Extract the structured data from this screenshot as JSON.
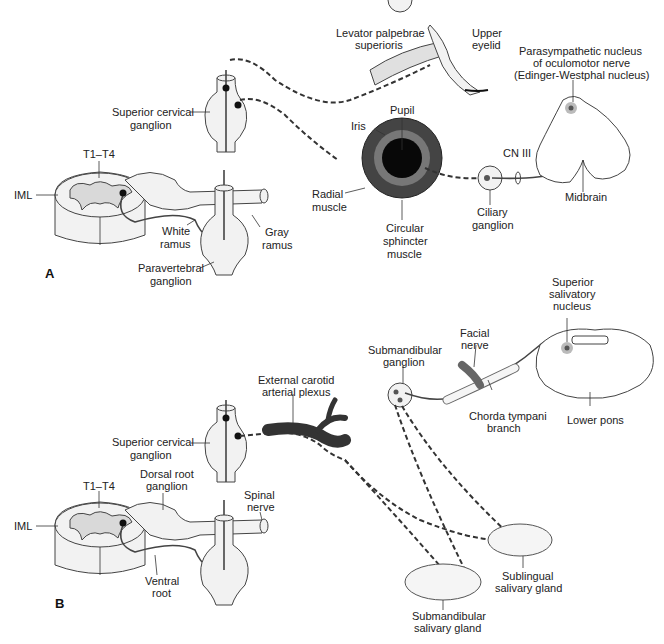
{
  "figure": {
    "panel_a": {
      "letter": "A",
      "labels": {
        "superior_cervical_ganglion_1": "Superior cervical",
        "superior_cervical_ganglion_2": "ganglion",
        "t1_t4": "T1–T4",
        "iml": "IML",
        "white_ramus_1": "White",
        "white_ramus_2": "ramus",
        "gray_ramus_1": "Gray",
        "gray_ramus_2": "ramus",
        "paravertebral_1": "Paravertebral",
        "paravertebral_2": "ganglion",
        "levator_1": "Levator palpebrae",
        "levator_2": "superioris",
        "upper_eyelid_1": "Upper",
        "upper_eyelid_2": "eyelid",
        "pupil": "Pupil",
        "iris": "Iris",
        "radial_1": "Radial",
        "radial_2": "muscle",
        "circular_1": "Circular",
        "circular_2": "sphincter",
        "circular_3": "muscle",
        "ciliary_1": "Ciliary",
        "ciliary_2": "ganglion",
        "cn3": "CN III",
        "ew_1": "Parasympathetic nucleus",
        "ew_2": "of oculomotor nerve",
        "ew_3": "(Edinger-Westphal nucleus)",
        "midbrain": "Midbrain"
      }
    },
    "panel_b": {
      "letter": "B",
      "labels": {
        "superior_cervical_ganglion_1": "Superior cervical",
        "superior_cervical_ganglion_2": "ganglion",
        "t1_t4": "T1–T4",
        "iml": "IML",
        "dorsal_root_1": "Dorsal root",
        "dorsal_root_2": "ganglion",
        "spinal_nerve_1": "Spinal",
        "spinal_nerve_2": "nerve",
        "ventral_root_1": "Ventral",
        "ventral_root_2": "root",
        "ext_carotid_1": "External carotid",
        "ext_carotid_2": "arterial plexus",
        "submand_ganglion_1": "Submandibular",
        "submand_ganglion_2": "ganglion",
        "facial_1": "Facial",
        "facial_2": "nerve",
        "chorda_1": "Chorda tympani",
        "chorda_2": "branch",
        "ssn_1": "Superior",
        "ssn_2": "salivatory",
        "ssn_3": "nucleus",
        "lower_pons": "Lower pons",
        "sublingual_1": "Sublingual",
        "sublingual_2": "salivary gland",
        "submand_gland_1": "Submandibular",
        "submand_gland_2": "salivary gland"
      }
    }
  }
}
